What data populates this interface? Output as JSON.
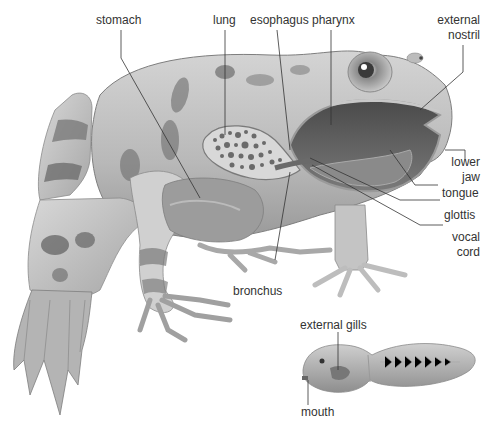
{
  "diagram": {
    "colors": {
      "background": "#ffffff",
      "label_text": "#333333",
      "leader_line": "#333333",
      "skin_light": "#cfcfcf",
      "skin_mid": "#a8a8a8",
      "skin_dark": "#6e6e6e",
      "cavity_dark": "#5a5a5a",
      "lung_fill": "#d8d8d8"
    },
    "labels": {
      "stomach": "stomach",
      "lung": "lung",
      "esophagus": "esophagus",
      "pharynx": "pharynx",
      "external_nostril_1": "external",
      "external_nostril_2": "nostril",
      "lower_jaw_1": "lower",
      "lower_jaw_2": "jaw",
      "tongue": "tongue",
      "glottis": "glottis",
      "vocal_cord_1": "vocal",
      "vocal_cord_2": "cord",
      "bronchus": "bronchus",
      "external_gills": "external gills",
      "mouth": "mouth"
    },
    "figures": [
      {
        "name": "adult frog cutaway",
        "region": "main"
      },
      {
        "name": "tadpole",
        "region": "bottom-right inset"
      }
    ]
  }
}
